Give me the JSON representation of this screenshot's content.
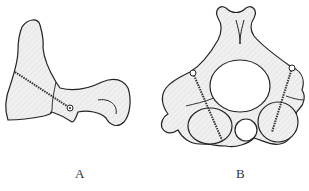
{
  "figure": {
    "panels": [
      {
        "id": "A",
        "label": "A",
        "description": "Lateral view of vertebra with screw fixation across fracture"
      },
      {
        "id": "B",
        "label": "B",
        "description": "Axial view of vertebra with bilateral screw fixation"
      }
    ],
    "colors": {
      "outline": "#222222",
      "fill": "#e6e6e6",
      "background": "#ffffff"
    }
  }
}
